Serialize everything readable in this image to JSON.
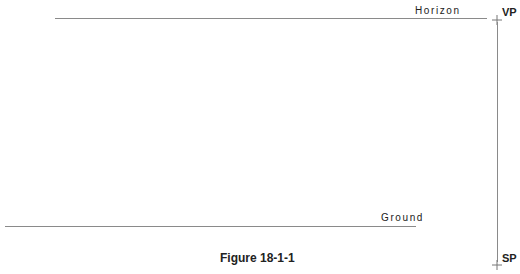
{
  "diagram": {
    "horizon": {
      "label": "Horizon"
    },
    "ground": {
      "label": "Ground"
    },
    "vanishing_point": {
      "label": "VP"
    },
    "station_point": {
      "label": "SP"
    },
    "caption": "Figure 18-1-1"
  }
}
